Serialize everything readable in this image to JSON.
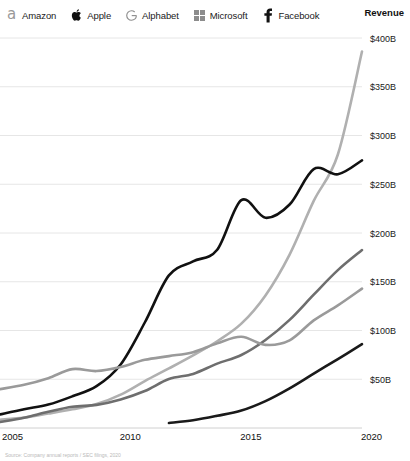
{
  "legend": {
    "items": [
      {
        "label": "Amazon",
        "icon": "amazon-logo-icon",
        "color": "#b0b0b0"
      },
      {
        "label": "Apple",
        "icon": "apple-logo-icon",
        "color": "#111111"
      },
      {
        "label": "Alphabet",
        "icon": "google-g-logo-icon",
        "color": "#6e6e6e"
      },
      {
        "label": "Microsoft",
        "icon": "microsoft-logo-icon",
        "color": "#9a9a9a"
      },
      {
        "label": "Facebook",
        "icon": "facebook-f-logo-icon",
        "color": "#1a1a1a"
      }
    ]
  },
  "axis_title": "Revenue",
  "source_note": "Source: Company annual reports / SEC filings, 2020",
  "chart_data": {
    "type": "line",
    "title": "Revenue",
    "xlabel": "",
    "ylabel": "Revenue",
    "xlim": [
      2005,
      2020
    ],
    "ylim": [
      0,
      400
    ],
    "grid": true,
    "legend_position": "top-left",
    "y_ticks": [
      50,
      100,
      150,
      200,
      250,
      300,
      350,
      400
    ],
    "y_tick_labels": [
      "$50B",
      "$100B",
      "$150B",
      "$200B",
      "$250B",
      "$300B",
      "$350B",
      "$400B"
    ],
    "x_ticks": [
      2005,
      2010,
      2015,
      2020
    ],
    "x_tick_labels": [
      "2005",
      "2010",
      "2015",
      "2020"
    ],
    "x": [
      2005,
      2006,
      2007,
      2008,
      2009,
      2010,
      2011,
      2012,
      2013,
      2014,
      2015,
      2016,
      2017,
      2018,
      2019,
      2020
    ],
    "series": [
      {
        "name": "Amazon",
        "color": "#b0b0b0",
        "values": [
          8.5,
          10.7,
          14.8,
          19.2,
          24.5,
          34.2,
          48.1,
          61.1,
          74.5,
          89.0,
          107.0,
          136.0,
          177.9,
          232.9,
          280.5,
          386.1
        ]
      },
      {
        "name": "Apple",
        "color": "#111111",
        "values": [
          13.9,
          19.3,
          24.0,
          32.5,
          42.9,
          65.2,
          108.2,
          156.5,
          170.9,
          182.8,
          233.7,
          215.6,
          229.2,
          265.6,
          260.2,
          274.5
        ]
      },
      {
        "name": "Alphabet",
        "color": "#6e6e6e",
        "values": [
          6.1,
          10.6,
          16.6,
          21.8,
          23.7,
          29.3,
          37.9,
          50.2,
          55.5,
          66.0,
          74.9,
          90.3,
          110.9,
          136.8,
          161.9,
          182.5
        ]
      },
      {
        "name": "Microsoft",
        "color": "#9a9a9a",
        "values": [
          39.8,
          44.3,
          51.1,
          60.4,
          58.4,
          62.5,
          69.9,
          73.7,
          77.8,
          86.8,
          93.6,
          85.3,
          89.9,
          110.4,
          125.8,
          143.0
        ]
      },
      {
        "name": "Facebook",
        "color": "#1a1a1a",
        "values": [
          null,
          null,
          null,
          null,
          null,
          null,
          null,
          5.1,
          7.9,
          12.5,
          17.9,
          27.6,
          40.7,
          55.8,
          70.7,
          86.0
        ]
      }
    ]
  }
}
